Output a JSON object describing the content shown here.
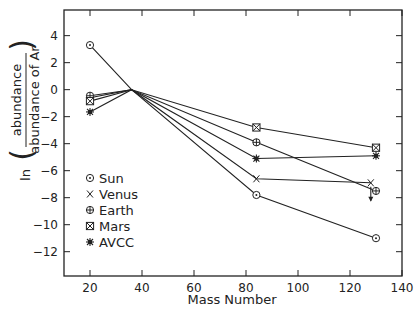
{
  "chart_data": {
    "type": "line",
    "title": "",
    "xlabel": "Mass Number",
    "ylabel": {
      "prefix": "ln",
      "numerator": "abundance",
      "denominator": "abundance of Ar"
    },
    "xlim": [
      10,
      140
    ],
    "ylim": [
      -13.8,
      5.9
    ],
    "xticks": [
      20,
      40,
      60,
      80,
      100,
      120,
      140
    ],
    "xtick_labels": [
      "20",
      "40",
      "60",
      "80",
      "100",
      "120",
      "140"
    ],
    "yticks": [
      4,
      2,
      0,
      -2,
      -4,
      -6,
      -8,
      -10,
      -12
    ],
    "ytick_labels": [
      "4",
      "2",
      "0",
      "-2",
      "-4",
      "-6",
      "-8",
      "-10",
      "-12"
    ],
    "grid": false,
    "legend_position": "lower-left inside",
    "series": [
      {
        "name": "Sun",
        "marker": "circle-dot",
        "x": [
          20,
          36,
          84,
          130
        ],
        "y": [
          3.3,
          0,
          -7.8,
          -11.0
        ]
      },
      {
        "name": "Venus",
        "marker": "x",
        "x": [
          20,
          36,
          84,
          128
        ],
        "y": [
          -0.6,
          0,
          -6.6,
          -6.9
        ],
        "annotation": "upper limit arrow at Xe (value is maximum)"
      },
      {
        "name": "Earth",
        "marker": "circle-plus",
        "x": [
          20,
          36,
          84,
          130
        ],
        "y": [
          -0.45,
          0,
          -3.9,
          -7.5
        ]
      },
      {
        "name": "Mars",
        "marker": "square-x",
        "x": [
          20,
          36,
          84,
          130
        ],
        "y": [
          -0.85,
          0,
          -2.8,
          -4.3
        ]
      },
      {
        "name": "AVCC",
        "marker": "asterisk",
        "x": [
          20,
          36,
          84,
          130
        ],
        "y": [
          -1.65,
          0,
          -5.1,
          -4.9
        ]
      }
    ]
  }
}
